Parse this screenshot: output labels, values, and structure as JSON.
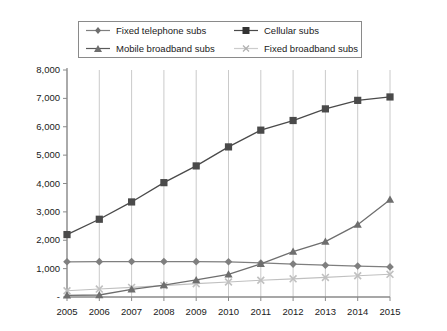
{
  "chart_data": {
    "type": "line",
    "title": "",
    "xlabel": "",
    "ylabel": "",
    "x": [
      2005,
      2006,
      2007,
      2008,
      2009,
      2010,
      2011,
      2012,
      2013,
      2014,
      2015
    ],
    "categories": [
      "2005",
      "2006",
      "2007",
      "2008",
      "2009",
      "2010",
      "2011",
      "2012",
      "2013",
      "2014",
      "2015"
    ],
    "xlim": [
      2005,
      2015
    ],
    "ylim": [
      0,
      8000
    ],
    "yticks": [
      0,
      1000,
      2000,
      3000,
      4000,
      5000,
      6000,
      7000,
      8000
    ],
    "ytick_labels": [
      "-",
      "1,000",
      "2,000",
      "3,000",
      "4,000",
      "5,000",
      "6,000",
      "7,000",
      "8,000"
    ],
    "grid": "vertical",
    "legend_position": "top",
    "series": [
      {
        "name": "Fixed telephone subs",
        "marker": "diamond",
        "color": "#7f7f7f",
        "values": [
          1240,
          1245,
          1250,
          1250,
          1245,
          1240,
          1200,
          1160,
          1120,
          1090,
          1060
        ]
      },
      {
        "name": "Cellular subs",
        "marker": "square",
        "color": "#4a4a4a",
        "values": [
          2200,
          2740,
          3350,
          4030,
          4620,
          5290,
          5880,
          6220,
          6630,
          6930,
          7050
        ]
      },
      {
        "name": "Mobile broadband subs",
        "marker": "triangle",
        "color": "#6e6e6e",
        "values": [
          60,
          70,
          270,
          420,
          600,
          800,
          1170,
          1600,
          1950,
          2550,
          3430
        ]
      },
      {
        "name": "Fixed broadband subs",
        "marker": "cross",
        "color": "#c0c0c0",
        "values": [
          220,
          280,
          340,
          400,
          470,
          530,
          590,
          640,
          690,
          750,
          800
        ]
      }
    ]
  },
  "legend": {
    "items": [
      {
        "label": "Fixed telephone subs",
        "marker": "diamond",
        "color": "#7f7f7f"
      },
      {
        "label": "Cellular subs",
        "marker": "square",
        "color": "#333333"
      },
      {
        "label": "Mobile broadband subs",
        "marker": "triangle",
        "color": "#6e6e6e"
      },
      {
        "label": "Fixed broadband subs",
        "marker": "cross",
        "color": "#c6c6c6"
      }
    ]
  },
  "axes": {
    "y_labels": [
      "8,000",
      "7,000",
      "6,000",
      "5,000",
      "4,000",
      "3,000",
      "2,000",
      "1,000",
      "-"
    ],
    "x_labels": [
      "2005",
      "2006",
      "2007",
      "2008",
      "2009",
      "2010",
      "2011",
      "2012",
      "2013",
      "2014",
      "2015"
    ]
  },
  "colors": {
    "axis": "#8a8a8a",
    "grid": "#bdbdbd",
    "text": "#1a1a1a",
    "background": "#ffffff"
  }
}
